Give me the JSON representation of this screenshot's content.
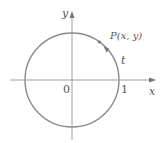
{
  "diagram": {
    "type": "unit-circle",
    "axes": {
      "x_label": "x",
      "y_label": "y",
      "origin_label": "0",
      "x_tick_label": "1"
    },
    "point": {
      "label": "P(x, y)"
    },
    "arc_label": "t",
    "colors": {
      "circle": "#8a8a8a",
      "axes": "#9a9a9a",
      "text": "#555555",
      "point": "#777777"
    }
  }
}
